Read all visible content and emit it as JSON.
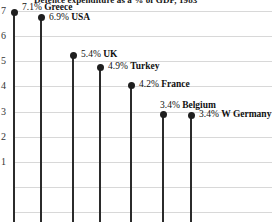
{
  "chart_data": {
    "type": "bar",
    "subtype": "lollipop-stem",
    "title": "Defence expenditure as a % of GDP, 1983",
    "categories": [
      "Greece",
      "USA",
      "UK",
      "Turkey",
      "France",
      "Belgium",
      "W Germany"
    ],
    "values": [
      7.1,
      6.9,
      5.4,
      4.9,
      4.2,
      3.4,
      3.4
    ],
    "value_suffix": "%",
    "point_labels": [
      "7.1% Greece",
      "6.9% USA",
      "5.4% UK",
      "4.9% Turkey",
      "4.2% France",
      "3.4% Belgium",
      "3.4% W Germany"
    ],
    "xlabel": "",
    "ylabel": "",
    "ylim": [
      0,
      7.4
    ],
    "yticks": [
      1,
      2,
      3,
      4,
      5,
      6,
      7
    ],
    "ytick_labels": [
      "1",
      "2",
      "3",
      "4",
      "5",
      "6",
      "7"
    ],
    "grid": true,
    "legend": false,
    "colors": {
      "marker": "#1f1f1f",
      "stem": "#2b2b2b",
      "gridline": "#d8d8d8",
      "text": "#111111",
      "background": "#ffffff"
    }
  },
  "series_points": [
    {
      "label": "7.1% Greece",
      "pct": "7.1%",
      "name": "Greece",
      "value": 7.1,
      "x": 14,
      "y": 12,
      "label_x": 22,
      "label_y": 2
    },
    {
      "label": "6.9% USA",
      "pct": "6.9%",
      "name": "USA",
      "value": 6.9,
      "x": 41,
      "y": 17,
      "label_x": 49,
      "label_y": 12
    },
    {
      "label": "5.4% UK",
      "pct": "5.4%",
      "name": "UK",
      "value": 5.4,
      "x": 73,
      "y": 55,
      "label_x": 81,
      "label_y": 49
    },
    {
      "label": "4.9% Turkey",
      "pct": "4.9%",
      "name": "Turkey",
      "value": 4.9,
      "x": 100,
      "y": 67,
      "label_x": 108,
      "label_y": 61
    },
    {
      "label": "4.2% France",
      "pct": "4.2%",
      "name": "France",
      "value": 4.2,
      "x": 131,
      "y": 85,
      "label_x": 139,
      "label_y": 79
    },
    {
      "label": "3.4% Belgium",
      "pct": "3.4%",
      "name": "Belgium",
      "value": 3.4,
      "x": 163,
      "y": 114,
      "label_x": 160,
      "label_y": 100
    },
    {
      "label": "3.4% W Germany",
      "pct": "3.4%",
      "name": "W Germany",
      "value": 3.4,
      "x": 191,
      "y": 115,
      "label_x": 199,
      "label_y": 109
    }
  ],
  "axis": {
    "ticks": [
      {
        "label": "7",
        "y": 6
      },
      {
        "label": "6",
        "y": 31
      },
      {
        "label": "5",
        "y": 56
      },
      {
        "label": "4",
        "y": 81
      },
      {
        "label": "3",
        "y": 107
      },
      {
        "label": "2",
        "y": 132
      },
      {
        "label": "1",
        "y": 157
      }
    ],
    "gridlines_y": [
      11,
      36,
      61,
      86,
      112,
      137,
      162,
      187,
      212
    ]
  }
}
